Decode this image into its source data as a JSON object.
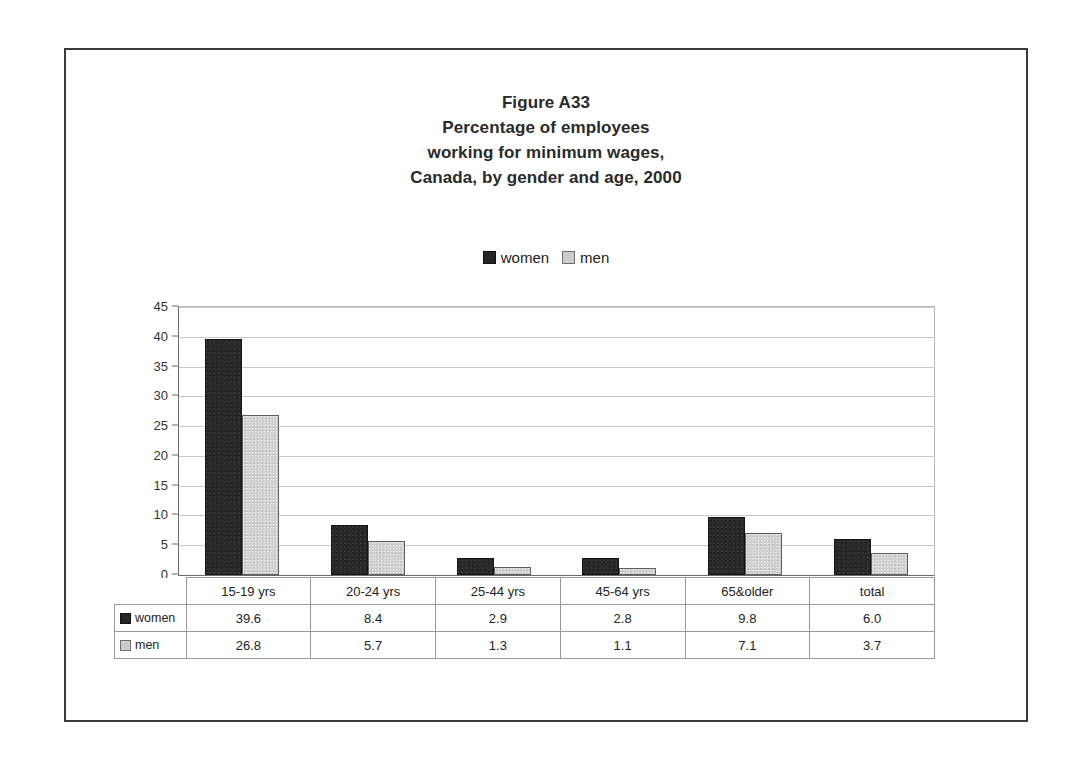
{
  "figure": {
    "title_lines": [
      "Figure A33",
      "Percentage of employees",
      "working for minimum wages,",
      "Canada, by gender and age, 2000"
    ],
    "colors": {
      "women": "#262626",
      "men": "#cccccc",
      "frame": "#3b3b3b",
      "gridline": "#c9c9c9",
      "axis": "#6b6b6b"
    }
  },
  "legend": {
    "items": [
      {
        "label": "women",
        "swatch": "dark-square-icon"
      },
      {
        "label": "men",
        "swatch": "light-square-icon"
      }
    ]
  },
  "chart_data": {
    "type": "bar",
    "title": "Figure A33 Percentage of employees working for minimum wages, Canada, by gender and age, 2000",
    "xlabel": "",
    "ylabel": "",
    "ylim": [
      0,
      45
    ],
    "yticks": [
      0,
      5,
      10,
      15,
      20,
      25,
      30,
      35,
      40,
      45
    ],
    "ytick_labels": [
      "0",
      "5",
      "10",
      "15",
      "20",
      "25",
      "30",
      "35",
      "40",
      "45"
    ],
    "grid": true,
    "legend_position": "top",
    "categories": [
      "15-19 yrs",
      "20-24 yrs",
      "25-44 yrs",
      "45-64 yrs",
      "65&older",
      "total"
    ],
    "series": [
      {
        "name": "women",
        "color": "#262626",
        "values": [
          39.6,
          8.4,
          2.9,
          2.8,
          9.8,
          6.0
        ]
      },
      {
        "name": "men",
        "color": "#cccccc",
        "values": [
          26.8,
          5.7,
          1.3,
          1.1,
          7.1,
          3.7
        ]
      }
    ]
  },
  "table": {
    "header": [
      "15-19 yrs",
      "20-24 yrs",
      "25-44 yrs",
      "45-64 yrs",
      "65&older",
      "total"
    ],
    "rows": [
      {
        "label": "women",
        "swatch": "dark-square-icon",
        "values": [
          "39.6",
          "8.4",
          "2.9",
          "2.8",
          "9.8",
          "6.0"
        ]
      },
      {
        "label": "men",
        "swatch": "light-square-icon",
        "values": [
          "26.8",
          "5.7",
          "1.3",
          "1.1",
          "7.1",
          "3.7"
        ]
      }
    ]
  }
}
